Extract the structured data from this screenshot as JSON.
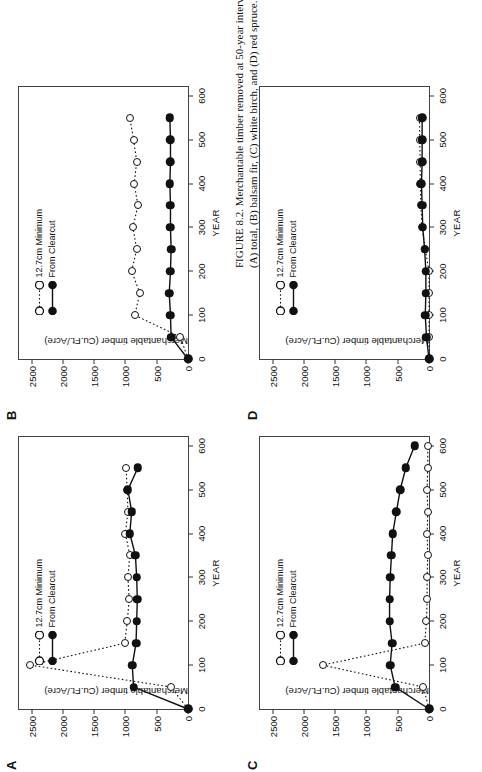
{
  "figure": {
    "caption_lead": "FIGURE 8.2.",
    "caption_text": " Merchantable timber removed at 50-year intervals for the site conditions of Table 8.1, for (A) total, (B) balsam fir, (C) white birch, and (D) red spruce."
  },
  "common": {
    "xlabel": "YEAR",
    "ylabel": "Merchantable timber (Cu.Ft./Acre)",
    "xticks": [
      0,
      100,
      200,
      300,
      400,
      500,
      600
    ],
    "yticks": [
      0,
      500,
      1000,
      1500,
      2000,
      2500
    ],
    "xlim": [
      0,
      620
    ],
    "ylim": [
      0,
      2700
    ],
    "legend": {
      "open_label": "12.7cm Minimum",
      "filled_label": "From Clearcut"
    },
    "colors": {
      "ink": "#111111",
      "axis": "#333333",
      "background": "#ffffff"
    }
  },
  "chart_data": [
    {
      "id": "A",
      "panel_letter": "A",
      "type": "line",
      "title": "(A) total",
      "xlabel": "YEAR",
      "ylabel": "Merchantable timber (Cu.Ft./Acre)",
      "xlim": [
        0,
        620
      ],
      "ylim": [
        0,
        2700
      ],
      "grid": false,
      "legend_position": "upper-left",
      "x": [
        0,
        50,
        100,
        150,
        200,
        250,
        300,
        350,
        400,
        450,
        500,
        550
      ],
      "series": [
        {
          "name": "12.7cm Minimum",
          "marker": "open-circle",
          "linestyle": "dotted",
          "values": [
            0,
            270,
            2520,
            1010,
            970,
            940,
            960,
            930,
            1000,
            960,
            970,
            990
          ]
        },
        {
          "name": "From Clearcut",
          "marker": "filled-circle",
          "linestyle": "solid",
          "values": [
            0,
            870,
            890,
            830,
            820,
            810,
            820,
            840,
            930,
            900,
            960,
            800
          ]
        }
      ]
    },
    {
      "id": "B",
      "panel_letter": "B",
      "type": "line",
      "title": "(B) balsam fir",
      "xlabel": "YEAR",
      "ylabel": "Merchantable timber (Cu.Ft./Acre)",
      "xlim": [
        0,
        620
      ],
      "ylim": [
        0,
        2700
      ],
      "grid": false,
      "legend_position": "upper-left",
      "x": [
        0,
        50,
        100,
        150,
        200,
        250,
        300,
        350,
        400,
        450,
        500,
        550
      ],
      "series": [
        {
          "name": "12.7cm Minimum",
          "marker": "open-circle",
          "linestyle": "dotted",
          "values": [
            0,
            120,
            850,
            770,
            900,
            820,
            880,
            800,
            860,
            820,
            870,
            930
          ]
        },
        {
          "name": "From Clearcut",
          "marker": "filled-circle",
          "linestyle": "solid",
          "values": [
            0,
            270,
            280,
            300,
            280,
            270,
            280,
            280,
            290,
            280,
            280,
            290
          ]
        }
      ]
    },
    {
      "id": "C",
      "panel_letter": "C",
      "type": "line",
      "title": "(C) white birch",
      "xlabel": "YEAR",
      "ylabel": "Merchantable timber (Cu.Ft./Acre)",
      "xlim": [
        0,
        620
      ],
      "ylim": [
        0,
        2700
      ],
      "grid": false,
      "legend_position": "upper-left",
      "x": [
        0,
        50,
        100,
        150,
        200,
        250,
        300,
        350,
        400,
        450,
        500,
        550,
        600
      ],
      "series": [
        {
          "name": "12.7cm Minimum",
          "marker": "open-circle",
          "linestyle": "dotted",
          "values": [
            0,
            90,
            1700,
            70,
            40,
            30,
            30,
            20,
            30,
            20,
            30,
            20,
            20
          ]
        },
        {
          "name": "From Clearcut",
          "marker": "filled-circle",
          "linestyle": "solid",
          "values": [
            0,
            540,
            620,
            590,
            630,
            630,
            620,
            600,
            580,
            520,
            460,
            370,
            230
          ]
        }
      ]
    },
    {
      "id": "D",
      "panel_letter": "D",
      "type": "line",
      "title": "(D) red spruce",
      "xlabel": "YEAR",
      "ylabel": "Merchantable timber (Cu.Ft./Acre)",
      "xlim": [
        0,
        620
      ],
      "ylim": [
        0,
        2700
      ],
      "grid": false,
      "legend_position": "upper-left",
      "x": [
        0,
        50,
        100,
        150,
        200,
        250,
        300,
        350,
        400,
        450,
        500,
        550
      ],
      "series": [
        {
          "name": "12.7cm Minimum",
          "marker": "open-circle",
          "linestyle": "dotted",
          "values": [
            0,
            0,
            0,
            0,
            0,
            60,
            110,
            130,
            140,
            140,
            150,
            150
          ]
        },
        {
          "name": "From Clearcut",
          "marker": "filled-circle",
          "linestyle": "solid",
          "values": [
            0,
            40,
            60,
            50,
            50,
            70,
            100,
            110,
            120,
            110,
            110,
            110
          ]
        }
      ]
    }
  ]
}
